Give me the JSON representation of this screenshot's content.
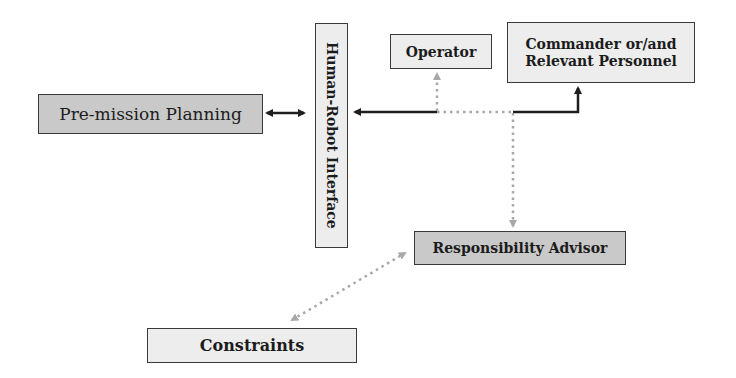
{
  "diagram": {
    "nodes": {
      "premission": {
        "label": "Pre-mission Planning"
      },
      "hri": {
        "label": "Human-Robot Interface"
      },
      "operator": {
        "label": "Operator"
      },
      "commander": {
        "line1": "Commander or/and",
        "line2": "Relevant Personnel"
      },
      "advisor": {
        "label": "Responsibility Advisor"
      },
      "constraints": {
        "label": "Constraints"
      }
    },
    "edges": [
      {
        "from": "Pre-mission Planning",
        "to": "Human-Robot Interface",
        "style": "solid",
        "direction": "bidirectional"
      },
      {
        "from": "Commander or/and Relevant Personnel",
        "to": "Human-Robot Interface",
        "style": "solid",
        "direction": "bidirectional"
      },
      {
        "from": "Responsibility Advisor",
        "to": "Operator",
        "style": "dotted",
        "direction": "one-way"
      },
      {
        "from": "Human-Robot Interface line",
        "to": "Responsibility Advisor",
        "style": "dotted",
        "direction": "one-way"
      },
      {
        "from": "Constraints",
        "to": "Responsibility Advisor",
        "style": "dotted",
        "direction": "bidirectional"
      }
    ],
    "colors": {
      "dark_fill": "#c9c9c9",
      "light_fill": "#ededed",
      "solid_line": "#1e1e1e",
      "dotted_line": "#a8a8a8"
    }
  }
}
